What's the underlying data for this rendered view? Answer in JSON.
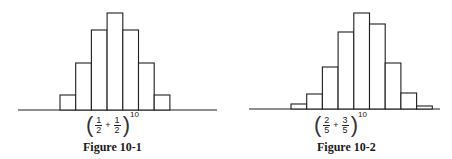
{
  "chart_data": [
    {
      "type": "bar",
      "title": "Figure 10-1",
      "formula": {
        "a_num": "1",
        "a_den": "2",
        "op": "+",
        "b_num": "1",
        "b_den": "2",
        "exponent": "10"
      },
      "categories": [
        "k1",
        "k2",
        "k3",
        "k4",
        "k5",
        "k6",
        "k7"
      ],
      "values": [
        15,
        47,
        80,
        97,
        80,
        47,
        15
      ],
      "xlabel": "",
      "ylabel": "",
      "grid": false,
      "legend": "none",
      "note": "Histogram of binomial distribution (1/2 + 1/2)^10; heights in relative units"
    },
    {
      "type": "bar",
      "title": "Figure 10-2",
      "formula": {
        "a_num": "2",
        "a_den": "5",
        "op": "+",
        "b_num": "3",
        "b_den": "5",
        "exponent": "10"
      },
      "categories": [
        "k1",
        "k2",
        "k3",
        "k4",
        "k5",
        "k6",
        "k7",
        "k8",
        "k9"
      ],
      "values": [
        5,
        15,
        42,
        77,
        96,
        85,
        46,
        16,
        3
      ],
      "xlabel": "",
      "ylabel": "",
      "grid": false,
      "legend": "none",
      "note": "Histogram of binomial distribution (2/5 + 3/5)^10; heights in relative units"
    }
  ],
  "figures": {
    "left": {
      "caption": "Figure 10-1",
      "a_num": "1",
      "a_den": "2",
      "op": "+",
      "b_num": "1",
      "b_den": "2",
      "exponent": "10"
    },
    "right": {
      "caption": "Figure 10-2",
      "a_num": "2",
      "a_den": "5",
      "op": "+",
      "b_num": "3",
      "b_den": "5",
      "exponent": "10"
    }
  },
  "style": {
    "stroke": "#1f1f1f",
    "fill": "#ffffff",
    "background": "#ffffff"
  }
}
